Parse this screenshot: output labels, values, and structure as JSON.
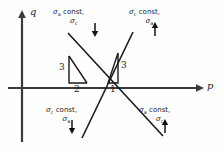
{
  "figure": {
    "type": "stress-path-diagram",
    "background": "#fefefe",
    "ink": "#1a1a1a",
    "axes": {
      "x_label": "p",
      "y_label": "q",
      "origin_px": [
        100,
        88
      ],
      "x_axis_from_px": [
        8,
        88
      ],
      "x_axis_to_px": [
        200,
        88
      ],
      "y_axis_from_px": [
        22,
        140
      ],
      "y_axis_to_px": [
        22,
        12
      ]
    },
    "quadrant_labels": {
      "top_left": {
        "line1_sigma": "σ",
        "line1_sub": "a",
        "line1_text": " const,",
        "line2_sigma": "σ",
        "line2_sub": "c",
        "arrow": "↓",
        "arrow_direction": "down"
      },
      "top_right": {
        "line1_sigma": "σ",
        "line1_sub": "c",
        "line1_text": " const,",
        "line2_sigma": "σ",
        "line2_sub": "a",
        "arrow": "↑",
        "arrow_direction": "up"
      },
      "bottom_left": {
        "line1_sigma": "σ",
        "line1_sub": "c",
        "line1_text": " const,",
        "line2_sigma": "σ",
        "line2_sub": "a",
        "arrow": "↓",
        "arrow_direction": "down"
      },
      "bottom_right": {
        "line1_sigma": "σ",
        "line1_sub": "a",
        "line1_text": " const,",
        "line2_sigma": "σ",
        "line2_sub": "c",
        "arrow": "↑",
        "arrow_direction": "up"
      }
    },
    "slope_triangles": {
      "left": {
        "vertical_label": "3",
        "horizontal_label": "2",
        "slope": "-3/2",
        "describes": "sigma-a constant path"
      },
      "right": {
        "vertical_label": "3",
        "horizontal_label": "1",
        "slope": "3/1",
        "describes": "sigma-c constant path"
      }
    },
    "paths": [
      {
        "name": "sigma-a-constant-line",
        "slope_ratio": "3:2 negative",
        "from_px": [
          68,
          33
        ],
        "to_px": [
          163,
          136
        ]
      },
      {
        "name": "sigma-c-constant-line",
        "slope_ratio": "3:1 positive",
        "from_px": [
          133,
          32
        ],
        "to_px": [
          82,
          138
        ]
      }
    ]
  }
}
